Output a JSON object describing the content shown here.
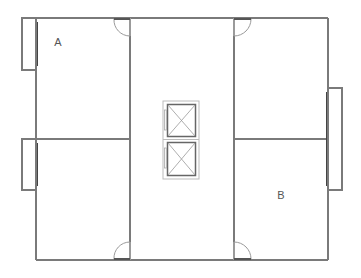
{
  "diagram": {
    "type": "floor-plan",
    "colors": {
      "wall": "#7a7a7a",
      "door_arc": "#9a9a9a",
      "elevator": "#777777",
      "label": "#555555",
      "background": "#ffffff"
    },
    "rooms": [
      {
        "id": "room-a",
        "label": "A",
        "position": "top-left"
      },
      {
        "id": "room-lower-left",
        "label": "",
        "position": "bottom-left"
      },
      {
        "id": "room-upper-right",
        "label": "",
        "position": "top-right"
      },
      {
        "id": "room-b",
        "label": "B",
        "position": "bottom-right"
      }
    ],
    "corridor": {
      "label": "",
      "position": "center"
    },
    "elevators": {
      "count": 2
    },
    "doors": {
      "count": 4
    },
    "bays": {
      "count": 3
    }
  }
}
